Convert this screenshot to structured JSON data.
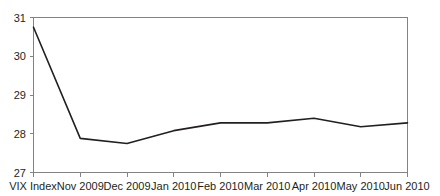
{
  "chart_data": {
    "type": "line",
    "title": "",
    "subtitle": "",
    "xlabel": "",
    "ylabel": "",
    "categories": [
      "VIX Index",
      "Nov 2009",
      "Dec 2009",
      "Jan 2010",
      "Feb 2010",
      "Mar 2010",
      "Apr 2010",
      "May 2010",
      "Jun 2010"
    ],
    "series": [
      {
        "name": "VIX Index",
        "values": [
          30.75,
          27.88,
          27.75,
          28.08,
          28.28,
          28.28,
          28.4,
          28.18,
          28.28
        ]
      }
    ],
    "ylim": [
      27,
      31
    ],
    "yticks": [
      27,
      28,
      29,
      30,
      31
    ],
    "ytick_labels": [
      "27",
      "28",
      "29",
      "30",
      "31"
    ],
    "xtick_labels": [
      "VIX Index",
      "Nov 2009",
      "Dec 2009",
      "Jan 2010",
      "Feb 2010",
      "Mar 2010",
      "Apr 2010",
      "May 2010",
      "Jun 2010"
    ],
    "grid": false,
    "legend": false,
    "legend_position": "none",
    "line_color": "#231f20",
    "axis_color": "#808285",
    "background_color": "#ffffff"
  }
}
